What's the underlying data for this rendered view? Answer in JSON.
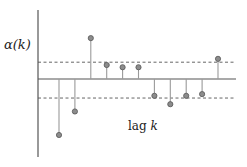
{
  "chart_data": {
    "type": "stem",
    "title": "",
    "ylabel": "α(k)",
    "xlabel": "lag k",
    "grid": false,
    "legend": null,
    "x": [
      1,
      2,
      3,
      4,
      5,
      6,
      7,
      8,
      9,
      10,
      11
    ],
    "values": [
      -1.0,
      -0.58,
      0.73,
      0.25,
      0.21,
      0.21,
      -0.3,
      -0.45,
      -0.3,
      -0.27,
      0.36
    ],
    "confidence_band": {
      "upper": 0.3,
      "lower": -0.34,
      "style": "dashed"
    },
    "ylim": [
      -1.35,
      1.25
    ],
    "colors": {
      "stem": "#9a9a9a",
      "marker_fill": "#8c8c8c",
      "marker_edge": "#555555",
      "axis": "#555555",
      "band": "#555555"
    }
  },
  "layout": {
    "axis_x": 38,
    "zero_y": 79,
    "first_stem_x": 59,
    "stem_spacing": 15.9,
    "unit_px": 56,
    "axis_top": 10,
    "axis_bottom": 157,
    "axis_right": 236
  }
}
